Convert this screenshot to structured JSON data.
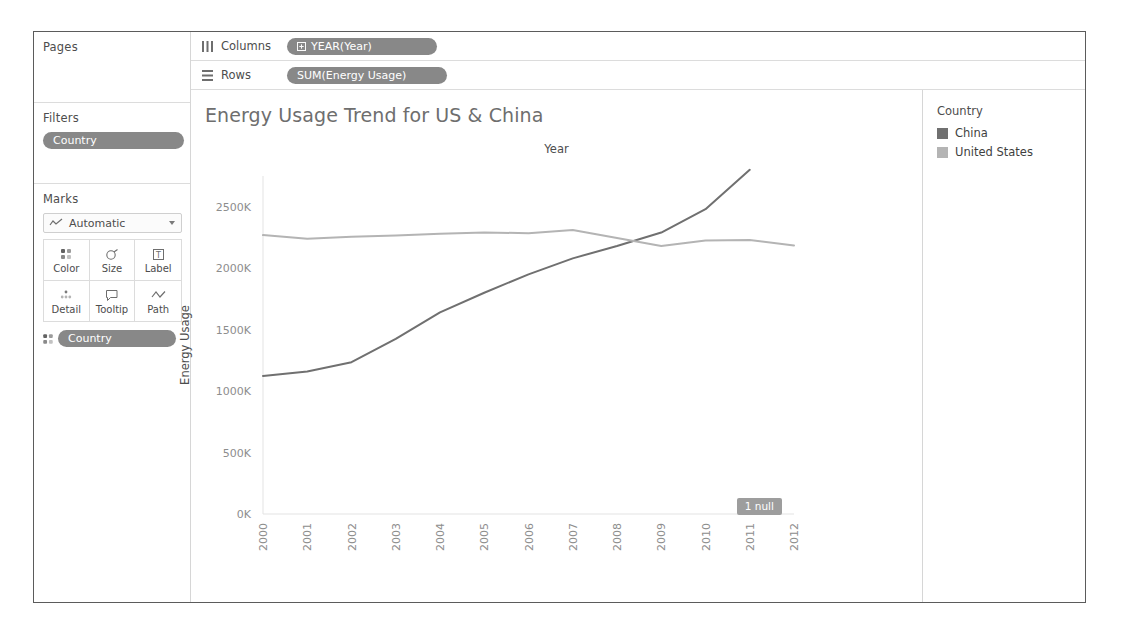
{
  "left_panel": {
    "pages": {
      "title": "Pages"
    },
    "filters": {
      "title": "Filters",
      "pills": [
        "Country"
      ]
    },
    "marks": {
      "title": "Marks",
      "mark_type": "Automatic",
      "mark_type_icon": "line-chart-icon",
      "buttons": [
        {
          "label": "Color",
          "icon": "color-dots-icon"
        },
        {
          "label": "Size",
          "icon": "size-circle-icon"
        },
        {
          "label": "Label",
          "icon": "label-text-icon"
        },
        {
          "label": "Detail",
          "icon": "detail-dots-icon"
        },
        {
          "label": "Tooltip",
          "icon": "tooltip-bubble-icon"
        },
        {
          "label": "Path",
          "icon": "path-line-icon"
        }
      ],
      "encoding_pills": [
        {
          "icon": "color-dots-icon",
          "label": "Country"
        }
      ]
    }
  },
  "shelves": {
    "columns": {
      "label": "Columns",
      "icon": "columns-icon",
      "pills": [
        {
          "icon": "hierarchy-plus-icon",
          "label": "YEAR(Year)"
        }
      ]
    },
    "rows": {
      "label": "Rows",
      "icon": "rows-icon",
      "pills": [
        {
          "icon": "",
          "label": "SUM(Energy Usage)"
        }
      ]
    }
  },
  "legend": {
    "title": "Country",
    "items": [
      {
        "label": "China",
        "color": "#707070"
      },
      {
        "label": "United States",
        "color": "#b4b4b4"
      }
    ]
  },
  "annotations": {
    "null_badge": "1 null"
  },
  "chart_data": {
    "type": "line",
    "title": "Energy Usage Trend for US & China",
    "xlabel": "Year",
    "ylabel": "Energy Usage",
    "x": [
      2000,
      2001,
      2002,
      2003,
      2004,
      2005,
      2006,
      2007,
      2008,
      2009,
      2010,
      2011,
      2012
    ],
    "xtick_labels": [
      "2000",
      "2001",
      "2002",
      "2003",
      "2004",
      "2005",
      "2006",
      "2007",
      "2008",
      "2009",
      "2010",
      "2011",
      "2012"
    ],
    "ytick_labels": [
      "0K",
      "500K",
      "1000K",
      "1500K",
      "2000K",
      "2500K"
    ],
    "ytick_values": [
      0,
      500000,
      1000000,
      1500000,
      2000000,
      2500000
    ],
    "ylim": [
      0,
      2750000
    ],
    "grid": false,
    "legend_position": "right",
    "series": [
      {
        "name": "China",
        "color": "#707070",
        "values": [
          1123000,
          1160000,
          1235000,
          1425000,
          1640000,
          1800000,
          1950000,
          2080000,
          2180000,
          2290000,
          2480000,
          2800000,
          null
        ]
      },
      {
        "name": "United States",
        "color": "#b4b4b4",
        "values": [
          2269000,
          2240000,
          2255000,
          2265000,
          2280000,
          2290000,
          2285000,
          2310000,
          2245000,
          2180000,
          2225000,
          2230000,
          2185000
        ]
      }
    ]
  }
}
